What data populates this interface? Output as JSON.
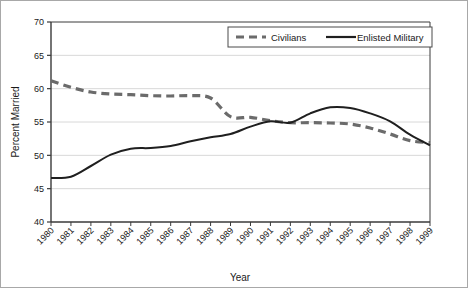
{
  "chart_data": {
    "type": "line",
    "title": "",
    "xlabel": "Year",
    "ylabel": "Percent Married",
    "x": [
      1980,
      1981,
      1982,
      1983,
      1984,
      1985,
      1986,
      1987,
      1988,
      1989,
      1990,
      1991,
      1992,
      1993,
      1994,
      1995,
      1996,
      1997,
      1998,
      1999
    ],
    "categories": [
      "1980",
      "1981",
      "1982",
      "1983",
      "1984",
      "1985",
      "1986",
      "1987",
      "1988",
      "1989",
      "1990",
      "1991",
      "1992",
      "1993",
      "1994",
      "1995",
      "1996",
      "1997",
      "1998",
      "1999"
    ],
    "xlim": [
      1980,
      1999
    ],
    "ylim": [
      40,
      70
    ],
    "yticks": [
      40,
      45,
      50,
      55,
      60,
      65,
      70
    ],
    "ytick_labels": [
      "40",
      "45",
      "50",
      "55",
      "60",
      "65",
      "70"
    ],
    "grid": "horizontal",
    "legend_position": "top-right",
    "series": [
      {
        "name": "Civilians",
        "style": "dashed",
        "color": "#6b6b6b",
        "values": [
          61.2,
          60.2,
          59.5,
          59.2,
          59.1,
          58.95,
          58.9,
          58.95,
          58.6,
          55.8,
          55.7,
          55.2,
          54.9,
          54.9,
          54.85,
          54.7,
          54.1,
          53.2,
          52.2,
          51.9
        ]
      },
      {
        "name": "Enlisted Military",
        "style": "solid",
        "color": "#1f1f1f",
        "values": [
          46.6,
          46.8,
          48.4,
          50.1,
          51.0,
          51.1,
          51.4,
          52.1,
          52.7,
          53.2,
          54.3,
          55.1,
          54.9,
          56.3,
          57.2,
          57.1,
          56.3,
          55.1,
          53.1,
          51.5
        ]
      }
    ]
  },
  "legend": {
    "items": [
      {
        "label": "Civilians",
        "style": "dashed",
        "color": "#6b6b6b"
      },
      {
        "label": "Enlisted Military",
        "style": "solid",
        "color": "#1f1f1f"
      }
    ]
  },
  "axes": {
    "x_title": "Year",
    "y_title": "Percent Married"
  }
}
